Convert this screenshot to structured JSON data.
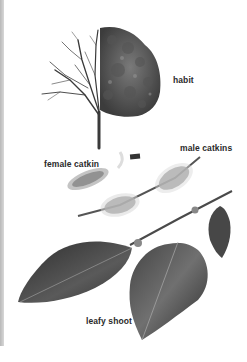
{
  "illustration": {
    "subject": "deciduous tree botanical plate",
    "labels": {
      "habit": "habit",
      "female_catkin": "female catkin",
      "male_catkins": "male catkins",
      "leafy_shoot": "leafy shoot"
    },
    "colors": {
      "background": "#ffffff",
      "ink": "#2a2a2a",
      "foliage_dark": "#3a3a3a",
      "foliage_mid": "#6a6a6a",
      "catkin": "#9a9a9a",
      "edge_strip": "#c0c0c0"
    }
  }
}
